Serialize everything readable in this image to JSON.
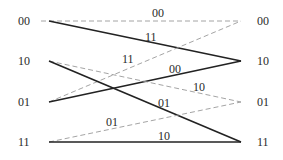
{
  "diagram": {
    "type": "trellis",
    "left_states": [
      {
        "label": "00",
        "y": 21
      },
      {
        "label": "10",
        "y": 61
      },
      {
        "label": "01",
        "y": 102
      },
      {
        "label": "11",
        "y": 142
      }
    ],
    "right_states": [
      {
        "label": "00",
        "y": 21
      },
      {
        "label": "10",
        "y": 61
      },
      {
        "label": "01",
        "y": 102
      },
      {
        "label": "11",
        "y": 142
      }
    ],
    "edges": [
      {
        "from": "00",
        "to": "00",
        "style": "dashed",
        "label": "00"
      },
      {
        "from": "00",
        "to": "10",
        "style": "solid",
        "label": "11"
      },
      {
        "from": "01",
        "to": "00",
        "style": "dashed",
        "label": "11"
      },
      {
        "from": "01",
        "to": "10",
        "style": "solid",
        "label": "00"
      },
      {
        "from": "10",
        "to": "01",
        "style": "dashed",
        "label": "10"
      },
      {
        "from": "10",
        "to": "11",
        "style": "solid",
        "label": "01"
      },
      {
        "from": "11",
        "to": "01",
        "style": "dashed",
        "label": "01"
      },
      {
        "from": "11",
        "to": "11",
        "style": "solid",
        "label": "10"
      }
    ],
    "colors": {
      "solid": "#222222",
      "dashed": "#9a9a9a",
      "text": "#2a2a2a"
    }
  }
}
